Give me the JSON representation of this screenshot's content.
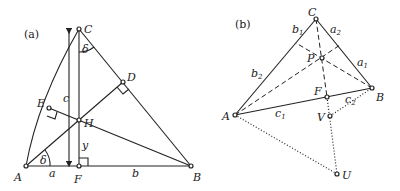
{
  "panel_a": {
    "tag": "(a)",
    "points": {
      "A": "A",
      "B": "B",
      "C": "C",
      "D": "D",
      "E": "E",
      "F": "F",
      "H": "H"
    },
    "labels": {
      "a": "a",
      "b": "b",
      "c": "c",
      "y": "y",
      "delta1": "δ",
      "delta2": "δ"
    }
  },
  "panel_b": {
    "tag": "(b)",
    "points": {
      "A": "A",
      "B": "B",
      "C": "C",
      "F": "F",
      "P": "P",
      "V": "V",
      "U": "U"
    },
    "labels": {
      "a1": "a",
      "a1_sub": "1",
      "a2": "a",
      "a2_sub": "2",
      "b1": "b",
      "b1_sub": "1",
      "b2": "b",
      "b2_sub": "2",
      "c1": "c",
      "c1_sub": "1",
      "c2": "c",
      "c2_sub": "2"
    }
  }
}
